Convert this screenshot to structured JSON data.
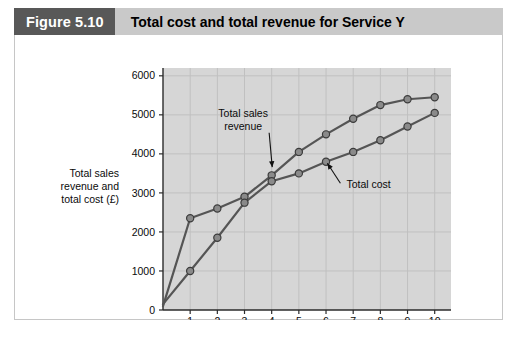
{
  "figure": {
    "number_label": "Figure 5.10",
    "title": "Total cost and total revenue for Service Y",
    "caption_fragment": ""
  },
  "colors": {
    "badge_background": "#585858",
    "header_background": "#c9c9c9",
    "plot_background": "#d6d6d6",
    "gridline": "#c0c0c0",
    "series_line": "#555555",
    "marker_fill": "#8a8a8a",
    "marker_stroke": "#3b3b3b",
    "axis": "#2b2b2b",
    "page_background": "#ffffff"
  },
  "chart_data": {
    "type": "line",
    "title": "Total cost and total revenue for Service Y",
    "xlabel": "Units of Service Y",
    "ylabel": "Total sales revenue and total cost (£)",
    "ylabel_lines": [
      "Total sales",
      "revenue and",
      "total cost (£)"
    ],
    "x": [
      0,
      1,
      2,
      3,
      4,
      5,
      6,
      7,
      8,
      9,
      10
    ],
    "xlim": [
      0,
      10.6
    ],
    "ylim": [
      0,
      6200
    ],
    "xticks": [
      1,
      2,
      3,
      4,
      5,
      6,
      7,
      8,
      9,
      10
    ],
    "xtick_labels": [
      "1",
      "2",
      "3",
      "4",
      "5",
      "6",
      "7",
      "8",
      "9",
      "10"
    ],
    "yticks": [
      0,
      1000,
      2000,
      3000,
      4000,
      5000,
      6000
    ],
    "ytick_labels": [
      "0",
      "1000",
      "2000",
      "3000",
      "4000",
      "5000",
      "6000"
    ],
    "grid": true,
    "legend": "annotations",
    "series": [
      {
        "name": "Total sales revenue",
        "annotation_lines": [
          "Total sales",
          "revenue"
        ],
        "x": [
          0,
          1,
          2,
          3,
          4,
          5,
          6,
          7,
          8,
          9,
          10
        ],
        "values": [
          100,
          2350,
          2600,
          2900,
          3450,
          4050,
          4500,
          4900,
          5250,
          5400,
          5450
        ]
      },
      {
        "name": "Total cost",
        "annotation_lines": [
          "Total cost"
        ],
        "x": [
          0,
          1,
          2,
          3,
          4,
          5,
          6,
          7,
          8,
          9,
          10
        ],
        "values": [
          150,
          1000,
          1850,
          2750,
          3300,
          3500,
          3800,
          4050,
          4350,
          4700,
          5050
        ]
      }
    ],
    "annotations": [
      {
        "text": "Total sales revenue",
        "target_series": 0,
        "target_x": 4
      },
      {
        "text": "Total cost",
        "target_series": 1,
        "target_x": 6
      }
    ]
  }
}
